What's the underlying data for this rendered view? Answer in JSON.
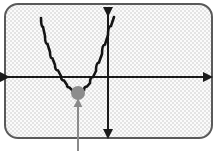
{
  "figure": {
    "panel": {
      "name": "textured-panel",
      "x": 5,
      "y": 4,
      "width": 207,
      "height": 134,
      "corner_radius": 13,
      "fill_color": "#e2e2e2",
      "border_color": "#5a5a5a",
      "border_width": 2,
      "texture": "fine-dotted-stipple",
      "texture_dot_color": "#ffffff",
      "texture_cell": 4
    },
    "axes": {
      "name": "coordinate-axes",
      "stroke_color": "#1a1a1a",
      "stroke_width": 2,
      "x_axis": {
        "label": "x-axis",
        "y": 77,
        "x_start": 8,
        "x_end": 211,
        "arrowheads": "both"
      },
      "y_axis": {
        "label": "y-axis",
        "x": 108,
        "y_start": 15,
        "y_end": 137,
        "arrowheads": "both"
      }
    },
    "curve": {
      "name": "parabola-curve",
      "stroke_color": "#141414",
      "stroke_width": 2.6,
      "opens": "upward",
      "vertex_x": 78,
      "vertex_y": 93,
      "left_end_x": 41,
      "left_end_y": 18,
      "right_end_x": 114,
      "right_end_y": 17
    },
    "vertex_marker": {
      "name": "vertex-dot",
      "cx": 78,
      "cy": 93,
      "r": 7,
      "fill_color": "#8c8c8c"
    },
    "pointer": {
      "name": "vertex-pointer-arrow",
      "x": 78,
      "tail_y": 151,
      "head_y": 100,
      "stroke_color": "#8a8a8a",
      "stroke_width": 2,
      "arrowhead": "top"
    }
  },
  "chart_data": {
    "type": "line",
    "xlabel": "x",
    "ylabel": "y",
    "grid": false,
    "legend": "none",
    "annotations": [
      {
        "label": "vertex",
        "x": 78,
        "y": 93,
        "marker": "filled-circle",
        "pointer": "arrow-from-below"
      }
    ],
    "series": [
      {
        "name": "parabola",
        "points": [
          [
            41,
            18
          ],
          [
            45,
            36
          ],
          [
            50,
            52
          ],
          [
            55,
            65
          ],
          [
            61,
            76
          ],
          [
            67,
            85
          ],
          [
            72,
            90
          ],
          [
            78,
            93
          ],
          [
            84,
            90
          ],
          [
            90,
            83
          ],
          [
            96,
            71
          ],
          [
            102,
            54
          ],
          [
            108,
            35
          ],
          [
            114,
            17
          ]
        ]
      }
    ]
  }
}
